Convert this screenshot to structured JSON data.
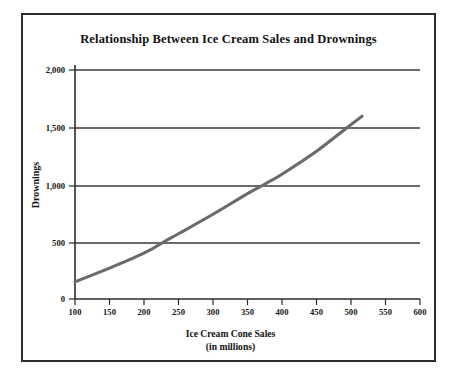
{
  "figure": {
    "title": "Relationship Between Ice Cream Sales and Drownings",
    "border_color": "#2e2e2e",
    "background": "#ffffff"
  },
  "chart_data": {
    "type": "line",
    "title": "Relationship Between Ice Cream Sales and Drownings",
    "subtitle": "",
    "xlabel": "Ice Cream Cone Sales",
    "xlabel_sub": "(in millions)",
    "ylabel": "Drownings",
    "xlim": [
      100,
      600
    ],
    "ylim": [
      0,
      2000
    ],
    "xticks": [
      100,
      150,
      200,
      250,
      300,
      350,
      400,
      450,
      500,
      550,
      600
    ],
    "xticklabels": [
      "100",
      "150",
      "200",
      "250",
      "300",
      "350",
      "400",
      "450",
      "500",
      "550",
      "600"
    ],
    "yticks": [
      0,
      500,
      1000,
      1500,
      2000
    ],
    "yticklabels": [
      "0",
      "500",
      "1,000",
      "1,500",
      "2,000"
    ],
    "grid": "horizontal",
    "legend": "none",
    "series": [
      {
        "name": "Drownings vs Ice Cream Cone Sales",
        "color": "#6a6a6a",
        "line_width": 3,
        "x": [
          100,
          150,
          200,
          229,
          250,
          300,
          350,
          374,
          400,
          450,
          495,
          516
        ],
        "y": [
          150,
          270,
          400,
          500,
          570,
          740,
          920,
          1000,
          1090,
          1290,
          1500,
          1596
        ]
      }
    ],
    "annotations": []
  }
}
